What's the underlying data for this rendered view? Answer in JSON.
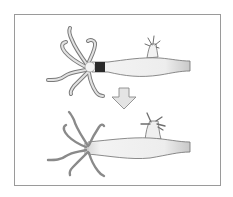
{
  "figure": {
    "colors": {
      "frame": "#9a9a9a",
      "outline": "#6e6e6e",
      "body_fill": "#f2f2f2",
      "marker_band": "#2a2a2a",
      "tentacle_top": "#d6d6d6",
      "tentacle_bottom": "#8a8a8a",
      "arrow_fill": "#e4e4e4"
    },
    "panels": [
      {
        "name": "top-hydra",
        "marker": "black band below hypostome",
        "bud": true
      },
      {
        "name": "arrow",
        "direction": "down"
      },
      {
        "name": "bottom-hydra",
        "marker": "shaded head region",
        "bud": true
      }
    ]
  }
}
